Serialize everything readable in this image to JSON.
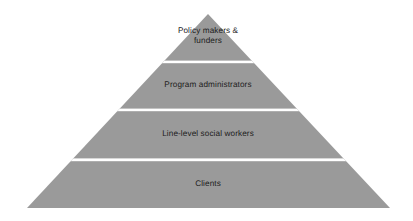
{
  "diagram": {
    "type": "pyramid",
    "background_color": "#ffffff",
    "fill_color": "#9a9a9a",
    "divider_color": "#ffffff",
    "text_color": "#1c1c1c",
    "tier_count": 4,
    "tiers": [
      {
        "index": 0,
        "label": "Policy makers &\nfunders",
        "level_name": "policy-makers-and-funders",
        "position": "top"
      },
      {
        "index": 1,
        "label": "Program administrators",
        "level_name": "program-administrators",
        "position": "second"
      },
      {
        "index": 2,
        "label": "Line-level social workers",
        "level_name": "line-level-social-workers",
        "position": "third"
      },
      {
        "index": 3,
        "label": "Clients",
        "level_name": "clients",
        "position": "base"
      }
    ]
  }
}
